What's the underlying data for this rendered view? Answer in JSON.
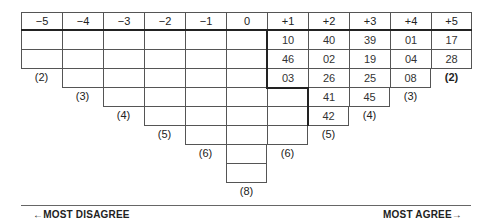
{
  "grid": {
    "columns": [
      {
        "label": "−5",
        "slots": 2,
        "count_label": "(2)",
        "values": [
          "",
          ""
        ]
      },
      {
        "label": "−4",
        "slots": 3,
        "count_label": "(3)",
        "values": [
          "",
          "",
          ""
        ]
      },
      {
        "label": "−3",
        "slots": 4,
        "count_label": "(4)",
        "values": [
          "",
          "",
          "",
          ""
        ]
      },
      {
        "label": "−2",
        "slots": 5,
        "count_label": "(5)",
        "values": [
          "",
          "",
          "",
          "",
          ""
        ]
      },
      {
        "label": "−1",
        "slots": 6,
        "count_label": "(6)",
        "values": [
          "",
          "",
          "",
          "",
          "",
          ""
        ]
      },
      {
        "label": "0",
        "slots": 8,
        "count_label": "(8)",
        "values": [
          "",
          "",
          "",
          "",
          "",
          "",
          "",
          ""
        ]
      },
      {
        "label": "+1",
        "slots": 6,
        "count_label": "(6)",
        "values": [
          "10",
          "46",
          "03",
          "",
          "",
          ""
        ]
      },
      {
        "label": "+2",
        "slots": 5,
        "count_label": "(5)",
        "values": [
          "40",
          "02",
          "26",
          "41",
          "42"
        ]
      },
      {
        "label": "+3",
        "slots": 4,
        "count_label": "(4)",
        "values": [
          "39",
          "19",
          "25",
          "45"
        ]
      },
      {
        "label": "+4",
        "slots": 3,
        "count_label": "(3)",
        "values": [
          "01",
          "04",
          "08"
        ]
      },
      {
        "label": "+5",
        "slots": 2,
        "count_label": "(2)",
        "values": [
          "17",
          "28"
        ]
      }
    ]
  },
  "footer": {
    "left_label": "←MOST DISAGREE",
    "right_label": "MOST AGREE→"
  }
}
